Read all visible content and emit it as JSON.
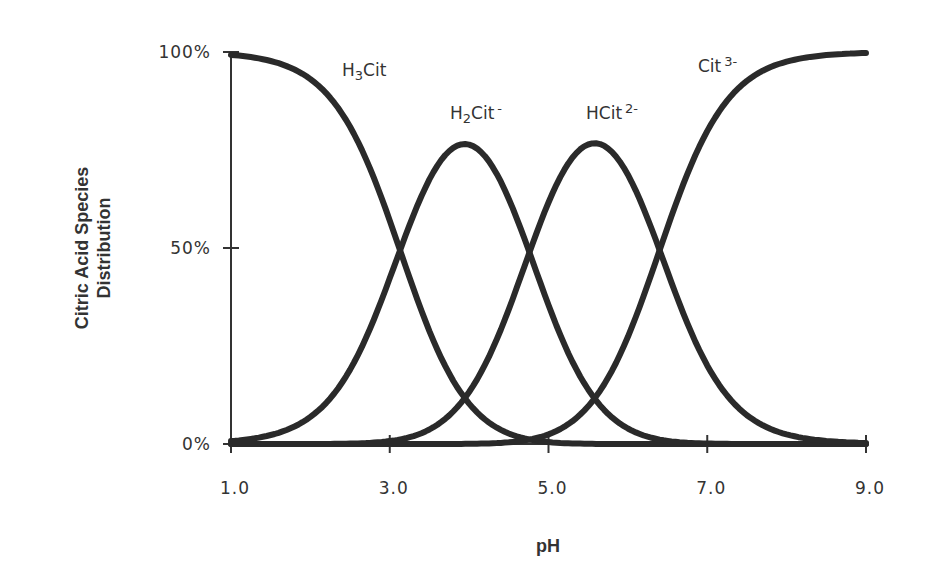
{
  "chart_data": {
    "type": "line",
    "title": "",
    "xlabel": "pH",
    "ylabel": "Citric Acid Species Distribution",
    "ylabel_lines": [
      "Citric Acid Species",
      "Distribution"
    ],
    "xlim": [
      1.0,
      9.0
    ],
    "ylim": [
      0,
      100
    ],
    "x_ticks": [
      1.0,
      3.0,
      5.0,
      7.0,
      9.0
    ],
    "x_tick_labels": [
      "1.0",
      "3.0",
      "5.0",
      "7.0",
      "9.0"
    ],
    "y_ticks": [
      0,
      50,
      100
    ],
    "y_tick_labels": [
      "0%",
      "50%",
      "100%"
    ],
    "grid": false,
    "legend": "inline labels",
    "pKa": [
      3.13,
      4.76,
      6.4
    ],
    "x": [
      1.0,
      1.5,
      2.0,
      2.5,
      3.0,
      3.5,
      4.0,
      4.5,
      5.0,
      5.5,
      6.0,
      6.5,
      7.0,
      7.5,
      8.0,
      8.5,
      9.0
    ],
    "series": [
      {
        "name": "H3Cit",
        "label_main": "H",
        "label_sub": "3",
        "label_rest": "Cit",
        "label_sup": "",
        "values": [
          99,
          98,
          88,
          70,
          43,
          19,
          6,
          2,
          0,
          0,
          0,
          0,
          0,
          0,
          0,
          0,
          0
        ]
      },
      {
        "name": "H2Cit-",
        "label_main": "H",
        "label_sub": "2",
        "label_rest": "Cit",
        "label_sup": "-",
        "values": [
          1,
          2,
          12,
          30,
          55,
          73,
          77,
          61,
          35,
          12,
          3,
          1,
          0,
          0,
          0,
          0,
          0
        ]
      },
      {
        "name": "HCit2-",
        "label_main": "HCit",
        "label_sub": "",
        "label_rest": "",
        "label_sup": "2-",
        "values": [
          0,
          0,
          0,
          0,
          2,
          8,
          17,
          35,
          56,
          76,
          68,
          45,
          20,
          7,
          2,
          1,
          0
        ]
      },
      {
        "name": "Cit3-",
        "label_main": "Cit",
        "label_sub": "",
        "label_rest": "",
        "label_sup": "3-",
        "values": [
          0,
          0,
          0,
          0,
          0,
          0,
          0,
          2,
          9,
          12,
          29,
          54,
          80,
          93,
          98,
          99,
          100
        ]
      }
    ],
    "label_positions": [
      {
        "x_px": 342,
        "y_px": 76
      },
      {
        "x_px": 450,
        "y_px": 119
      },
      {
        "x_px": 586,
        "y_px": 119
      },
      {
        "x_px": 698,
        "y_px": 72
      }
    ]
  }
}
